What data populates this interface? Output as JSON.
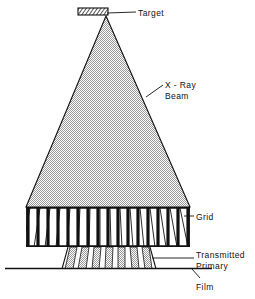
{
  "figure": {
    "type": "line-diagram",
    "background_color": "#ffffff",
    "ink_color": "#111111",
    "beam_fill_color": "#c9c9c9",
    "labels": {
      "target": "Target",
      "xray_beam_line1": "X - Ray",
      "xray_beam_line2": "Beam",
      "grid": "Grid",
      "transmitted_line1": "Transmitted",
      "transmitted_line2": "Primary",
      "film": "Film"
    },
    "components": {
      "target": {
        "name": "target",
        "shape": "hatched-rectangle",
        "x": 78,
        "y": 8,
        "width": 30,
        "height": 7,
        "hatch_angle_deg": 35
      },
      "beam": {
        "name": "x-ray-beam",
        "shape": "triangle",
        "apex_x": 106,
        "apex_y": 16,
        "base_left_x": 26,
        "base_right_x": 190,
        "base_y": 207
      },
      "grid": {
        "name": "antiscatter-grid",
        "left": 26,
        "right": 190,
        "top": 207,
        "bottom": 247,
        "septa_count": 17,
        "septa_width": 3
      },
      "transmitted_primary": {
        "name": "transmitted-primary",
        "top": 247,
        "bottom": 268,
        "left": 64,
        "right": 152
      },
      "film": {
        "name": "film",
        "y": 268,
        "x_start": 5,
        "x_end": 212
      }
    },
    "leaders": {
      "target": {
        "x1": 136,
        "y1": 12,
        "x2": 106,
        "y2": 12
      },
      "xray": {
        "x1": 163,
        "y1": 85,
        "x2": 146,
        "y2": 97
      },
      "grid": {
        "x1": 194,
        "y1": 216,
        "x2": 186,
        "y2": 216
      },
      "transmitted": {
        "x1": 194,
        "y1": 258,
        "x2": 155,
        "y2": 258
      },
      "film": {
        "x1": 200,
        "y1": 279,
        "x2": 193,
        "y2": 268
      }
    }
  }
}
